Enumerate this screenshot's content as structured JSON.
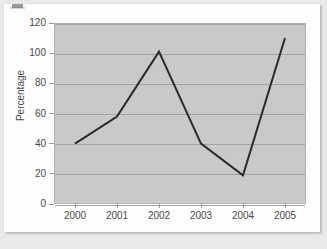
{
  "chart_data": {
    "type": "line",
    "title": "",
    "xlabel": "",
    "ylabel": "Percentage",
    "categories": [
      "2000",
      "2001",
      "2002",
      "2003",
      "2004",
      "2005"
    ],
    "x": [
      2000,
      2001,
      2002,
      2003,
      2004,
      2005
    ],
    "series": [
      {
        "name": "Percentage",
        "values": [
          40,
          58,
          101,
          40,
          19,
          110
        ],
        "color": "#2a2a2a",
        "line_width": 2,
        "markers": false
      }
    ],
    "ylim": [
      0,
      120
    ],
    "yticks": [
      0,
      20,
      40,
      60,
      80,
      100,
      120
    ],
    "ytick_labels": [
      "0",
      "20",
      "40",
      "60",
      "80",
      "100",
      "120"
    ],
    "xtick_labels": [
      "2000",
      "2001",
      "2002",
      "2003",
      "2004",
      "2005"
    ],
    "grid": true,
    "grid_axis": "y",
    "legend": false,
    "legend_position": "none",
    "plot_background": "#c9c9c9",
    "figure_background": "#fdfdfd",
    "axis_color": "#9a9a9a",
    "gridline_color": "#a2a2a2",
    "tick_label_color": "#4a4a4a"
  },
  "page": {
    "background_color": "#e9e9e9",
    "card_background": "#fdfdfd",
    "artifact": "scan-smudge"
  }
}
